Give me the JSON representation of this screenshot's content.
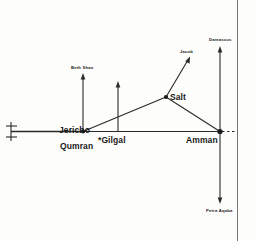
{
  "diagram": {
    "nodes": [
      {
        "id": "jericho",
        "label": "Jericho",
        "x": 83,
        "y": 133,
        "size": "major"
      },
      {
        "id": "qumran",
        "label": "Qumran",
        "x": 83,
        "y": 147,
        "size": "major"
      },
      {
        "id": "gilgal",
        "label": "*Gilgal",
        "x": 113,
        "y": 141,
        "size": "major"
      },
      {
        "id": "salt",
        "label": "Salt",
        "x": 168,
        "y": 99,
        "size": "major"
      },
      {
        "id": "amman",
        "label": "Amman",
        "x": 205,
        "y": 140,
        "size": "major"
      },
      {
        "id": "beth-shan",
        "label": "Beth Shan",
        "x": 83,
        "y": 70,
        "size": "minor"
      },
      {
        "id": "jacob",
        "label": "Jacob",
        "x": 186,
        "y": 53,
        "size": "minor"
      },
      {
        "id": "damascus",
        "label": "Damascus",
        "x": 220,
        "y": 41,
        "size": "minor"
      },
      {
        "id": "petra-aqaba",
        "label": "Petra Aqaba",
        "x": 220,
        "y": 212,
        "size": "minor"
      }
    ],
    "edges": [
      {
        "id": "road-west-jericho",
        "from": "west-terminus",
        "to": "jericho"
      },
      {
        "id": "road-jericho-amman",
        "from": "jericho",
        "to": "amman"
      },
      {
        "id": "road-jericho-salt",
        "from": "jericho",
        "to": "salt"
      },
      {
        "id": "road-salt-amman",
        "from": "salt",
        "to": "amman"
      },
      {
        "id": "road-amman-dashed",
        "from": "amman",
        "to": "east-continuation",
        "style": "dashed"
      }
    ],
    "arrows": [
      {
        "id": "arrow-jericho-beth-shan",
        "from": "jericho",
        "to": "beth-shan",
        "direction": "north"
      },
      {
        "id": "arrow-gilgal-north",
        "from": "gilgal",
        "to": "north",
        "direction": "north"
      },
      {
        "id": "arrow-salt-jacob",
        "from": "salt",
        "to": "jacob",
        "direction": "northeast"
      },
      {
        "id": "arrow-amman-damascus",
        "from": "amman",
        "to": "damascus",
        "direction": "north"
      },
      {
        "id": "arrow-amman-petra",
        "from": "amman",
        "to": "petra-aqaba",
        "direction": "south"
      }
    ],
    "colors": {
      "ink": "#2a2a2a",
      "background": "#fdfdfb",
      "page_edge": "#5d5d5d"
    }
  }
}
